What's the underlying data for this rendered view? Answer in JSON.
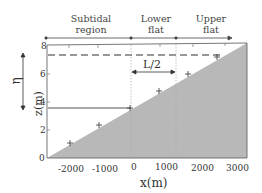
{
  "diagram": {
    "regions": [
      {
        "label_line1": "Subtidal",
        "label_line2": "region"
      },
      {
        "label_line1": "Lower",
        "label_line2": "flat"
      },
      {
        "label_line1": "Upper",
        "label_line2": "flat"
      }
    ],
    "annotations": {
      "eta": "η",
      "half_length": "L/2"
    },
    "x_axis": {
      "title": "x(m)",
      "ticks": [
        "-2000",
        "-1000",
        "0",
        "1000",
        "2000",
        "3000"
      ]
    },
    "y_axis": {
      "title": "z(m)",
      "ticks": [
        "0",
        "2",
        "4",
        "6",
        "8"
      ]
    },
    "colors": {
      "fill": "#b8b8b8",
      "dashed_line": "#777777",
      "solid_line": "#555555",
      "frame": "#555555"
    }
  }
}
